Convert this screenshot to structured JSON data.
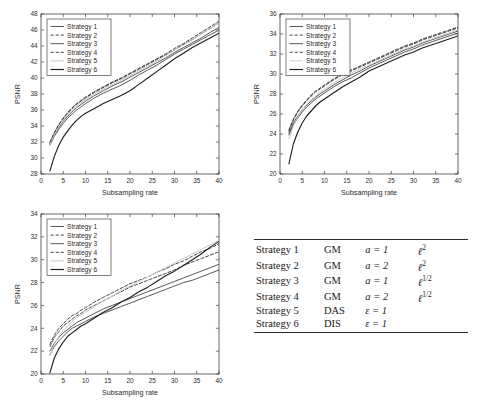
{
  "figure": {
    "axis_label_x": "Subsampling rate",
    "axis_label_y": "PSNR",
    "legend_entries": [
      "Strategy 1",
      "Strategy 2",
      "Strategy 3",
      "Strategy 4",
      "Strategy 5",
      "Strategy 6"
    ],
    "line_styles": [
      "solid",
      "dashed",
      "solid",
      "dashed",
      "solid-light",
      "solid-bold"
    ],
    "colors": {
      "axis": "#262626",
      "grid": "#d9d9d9",
      "s1": "#3a3a3a",
      "s2": "#2b2b2b",
      "s3": "#4a4a4a",
      "s4": "#333333",
      "s5": "#c9c9c9",
      "s6": "#1f1f1f"
    }
  },
  "chart_data": [
    {
      "type": "line",
      "panel": "top-left",
      "title": "",
      "xlabel": "Subsampling rate",
      "ylabel": "PSNR",
      "xlim": [
        0,
        40
      ],
      "ylim": [
        28,
        48
      ],
      "xticks": [
        0,
        5,
        10,
        15,
        20,
        25,
        30,
        35,
        40
      ],
      "yticks": [
        28,
        30,
        32,
        34,
        36,
        38,
        40,
        42,
        44,
        46,
        48
      ],
      "grid": false,
      "legend_position": "upper-left",
      "x": [
        2,
        3,
        4,
        5,
        6,
        7,
        8,
        9,
        10,
        12,
        14,
        16,
        18,
        20,
        22,
        24,
        26,
        28,
        30,
        32,
        34,
        36,
        38,
        40
      ],
      "series": [
        {
          "name": "Strategy 1",
          "style": "solid",
          "values": [
            31.6,
            32.7,
            33.6,
            34.3,
            35.0,
            35.5,
            36.0,
            36.4,
            36.8,
            37.5,
            38.1,
            38.6,
            39.1,
            39.7,
            40.4,
            41.0,
            41.6,
            42.3,
            43.0,
            43.6,
            44.2,
            44.8,
            45.4,
            46.0
          ]
        },
        {
          "name": "Strategy 2",
          "style": "dashed",
          "values": [
            31.9,
            33.1,
            34.1,
            34.9,
            35.6,
            36.2,
            36.7,
            37.1,
            37.5,
            38.2,
            38.8,
            39.4,
            39.9,
            40.5,
            41.1,
            41.7,
            42.3,
            42.9,
            43.5,
            44.2,
            44.8,
            45.5,
            46.2,
            46.9
          ]
        },
        {
          "name": "Strategy 3",
          "style": "solid",
          "values": [
            31.8,
            32.9,
            33.8,
            34.6,
            35.2,
            35.8,
            36.3,
            36.7,
            37.1,
            37.8,
            38.4,
            39.0,
            39.5,
            40.1,
            40.7,
            41.3,
            41.9,
            42.5,
            43.2,
            43.8,
            44.4,
            45.0,
            45.7,
            46.3
          ]
        },
        {
          "name": "Strategy 4",
          "style": "dashed",
          "values": [
            32.0,
            33.2,
            34.2,
            35.0,
            35.7,
            36.3,
            36.8,
            37.2,
            37.6,
            38.3,
            38.9,
            39.5,
            40.0,
            40.6,
            41.2,
            41.8,
            42.4,
            43.0,
            43.7,
            44.3,
            45.0,
            45.7,
            46.4,
            47.1
          ]
        },
        {
          "name": "Strategy 5",
          "style": "solid-light",
          "values": [
            31.7,
            32.9,
            33.9,
            34.7,
            35.4,
            36.0,
            36.5,
            36.9,
            37.3,
            38.0,
            38.6,
            39.2,
            39.7,
            40.3,
            40.9,
            41.5,
            42.1,
            42.8,
            43.5,
            44.1,
            44.8,
            45.5,
            46.2,
            46.9
          ]
        },
        {
          "name": "Strategy 6",
          "style": "solid-bold",
          "values": [
            28.4,
            30.2,
            31.6,
            32.6,
            33.4,
            34.1,
            34.7,
            35.2,
            35.6,
            36.2,
            36.8,
            37.3,
            37.8,
            38.4,
            39.2,
            40.0,
            40.8,
            41.6,
            42.4,
            43.1,
            43.8,
            44.4,
            45.0,
            45.6
          ]
        }
      ]
    },
    {
      "type": "line",
      "panel": "top-right",
      "title": "",
      "xlabel": "Subsampling rate",
      "ylabel": "PSNR",
      "xlim": [
        0,
        40
      ],
      "ylim": [
        20,
        36
      ],
      "xticks": [
        0,
        5,
        10,
        15,
        20,
        25,
        30,
        35,
        40
      ],
      "yticks": [
        20,
        22,
        24,
        26,
        28,
        30,
        32,
        34,
        36
      ],
      "grid": false,
      "legend_position": "upper-left",
      "x": [
        2,
        3,
        4,
        5,
        6,
        7,
        8,
        9,
        10,
        12,
        14,
        16,
        18,
        20,
        22,
        24,
        26,
        28,
        30,
        32,
        34,
        36,
        38,
        40
      ],
      "series": [
        {
          "name": "Strategy 1",
          "style": "solid",
          "values": [
            23.9,
            24.9,
            25.6,
            26.2,
            26.7,
            27.1,
            27.5,
            27.8,
            28.1,
            28.7,
            29.2,
            29.6,
            30.1,
            30.6,
            31.0,
            31.4,
            31.8,
            32.2,
            32.5,
            32.9,
            33.2,
            33.5,
            33.8,
            34.1
          ]
        },
        {
          "name": "Strategy 2",
          "style": "dashed",
          "values": [
            24.3,
            25.4,
            26.2,
            26.8,
            27.3,
            27.8,
            28.2,
            28.5,
            28.8,
            29.4,
            29.9,
            30.3,
            30.7,
            31.1,
            31.5,
            31.9,
            32.3,
            32.7,
            33.0,
            33.4,
            33.7,
            34.0,
            34.3,
            34.6
          ]
        },
        {
          "name": "Strategy 3",
          "style": "solid",
          "values": [
            24.1,
            25.1,
            25.8,
            26.4,
            26.9,
            27.3,
            27.7,
            28.0,
            28.3,
            28.9,
            29.4,
            29.9,
            30.3,
            30.8,
            31.2,
            31.6,
            32.0,
            32.4,
            32.7,
            33.1,
            33.4,
            33.7,
            34.0,
            34.3
          ]
        },
        {
          "name": "Strategy 4",
          "style": "dashed",
          "values": [
            24.4,
            25.5,
            26.3,
            26.9,
            27.4,
            27.9,
            28.3,
            28.6,
            28.9,
            29.5,
            30.0,
            30.4,
            30.8,
            31.2,
            31.6,
            32.0,
            32.4,
            32.8,
            33.1,
            33.5,
            33.8,
            34.1,
            34.4,
            34.7
          ]
        },
        {
          "name": "Strategy 5",
          "style": "solid-light",
          "values": [
            23.5,
            24.8,
            25.7,
            26.4,
            27.0,
            27.4,
            27.8,
            28.2,
            28.5,
            29.1,
            29.6,
            30.1,
            30.5,
            30.9,
            31.3,
            31.7,
            32.1,
            32.5,
            32.8,
            33.2,
            33.5,
            33.8,
            34.1,
            34.4
          ]
        },
        {
          "name": "Strategy 6",
          "style": "solid-bold",
          "values": [
            21.0,
            23.0,
            24.2,
            25.1,
            25.8,
            26.3,
            26.8,
            27.2,
            27.5,
            28.1,
            28.7,
            29.2,
            29.7,
            30.3,
            30.7,
            31.1,
            31.5,
            31.9,
            32.2,
            32.6,
            32.9,
            33.2,
            33.5,
            33.8
          ]
        }
      ]
    },
    {
      "type": "line",
      "panel": "bottom-left",
      "title": "",
      "xlabel": "Subsampling rate",
      "ylabel": "PSNR",
      "xlim": [
        0,
        40
      ],
      "ylim": [
        20,
        34
      ],
      "xticks": [
        0,
        5,
        10,
        15,
        20,
        25,
        30,
        35,
        40
      ],
      "yticks": [
        20,
        22,
        24,
        26,
        28,
        30,
        32,
        34
      ],
      "grid": false,
      "legend_position": "upper-left",
      "x": [
        2,
        3,
        4,
        5,
        6,
        7,
        8,
        9,
        10,
        12,
        14,
        16,
        18,
        20,
        22,
        24,
        26,
        28,
        30,
        32,
        34,
        36,
        38,
        40
      ],
      "series": [
        {
          "name": "Strategy 1",
          "style": "solid",
          "values": [
            21.7,
            22.4,
            22.9,
            23.3,
            23.7,
            24.0,
            24.2,
            24.4,
            24.6,
            25.0,
            25.3,
            25.6,
            25.9,
            26.2,
            26.5,
            26.8,
            27.1,
            27.4,
            27.7,
            28.0,
            28.2,
            28.5,
            28.8,
            29.1
          ]
        },
        {
          "name": "Strategy 2",
          "style": "dashed",
          "values": [
            22.4,
            23.2,
            23.7,
            24.2,
            24.5,
            24.8,
            25.1,
            25.3,
            25.6,
            26.0,
            26.4,
            26.8,
            27.2,
            27.6,
            27.9,
            28.2,
            28.5,
            28.8,
            29.1,
            29.5,
            29.8,
            30.1,
            30.4,
            30.7
          ]
        },
        {
          "name": "Strategy 3",
          "style": "solid",
          "values": [
            22.0,
            22.7,
            23.2,
            23.6,
            23.9,
            24.2,
            24.5,
            24.7,
            24.9,
            25.3,
            25.7,
            26.0,
            26.3,
            26.6,
            26.9,
            27.2,
            27.5,
            27.8,
            28.1,
            28.4,
            28.7,
            29.0,
            29.3,
            29.6
          ]
        },
        {
          "name": "Strategy 4",
          "style": "dashed",
          "values": [
            22.6,
            23.4,
            24.0,
            24.4,
            24.8,
            25.1,
            25.3,
            25.6,
            25.8,
            26.3,
            26.7,
            27.1,
            27.5,
            27.9,
            28.2,
            28.5,
            28.9,
            29.2,
            29.6,
            29.9,
            30.3,
            30.7,
            31.0,
            31.4
          ]
        },
        {
          "name": "Strategy 5",
          "style": "solid-light",
          "values": [
            21.6,
            22.6,
            23.3,
            23.8,
            24.2,
            24.6,
            24.9,
            25.2,
            25.4,
            25.9,
            26.4,
            26.8,
            27.3,
            27.7,
            28.1,
            28.5,
            28.9,
            29.3,
            29.7,
            30.1,
            30.5,
            30.9,
            31.3,
            31.7
          ]
        },
        {
          "name": "Strategy 6",
          "style": "solid-bold",
          "values": [
            20.1,
            21.4,
            22.2,
            22.8,
            23.3,
            23.6,
            23.9,
            24.2,
            24.4,
            24.9,
            25.4,
            25.8,
            26.3,
            26.7,
            27.2,
            27.6,
            28.1,
            28.6,
            29.0,
            29.5,
            30.0,
            30.5,
            31.1,
            31.6
          ]
        }
      ]
    }
  ],
  "table": {
    "rows": [
      {
        "name": "Strategy 1",
        "method": "GM",
        "param": "a = 1",
        "norm_base": "ℓ",
        "norm_exp": "2"
      },
      {
        "name": "Strategy 2",
        "method": "GM",
        "param": "a = 2",
        "norm_base": "ℓ",
        "norm_exp": "2"
      },
      {
        "name": "Strategy 3",
        "method": "GM",
        "param": "a = 1",
        "norm_base": "ℓ",
        "norm_exp": "1/2"
      },
      {
        "name": "Strategy 4",
        "method": "GM",
        "param": "a = 2",
        "norm_base": "ℓ",
        "norm_exp": "1/2"
      },
      {
        "name": "Strategy 5",
        "method": "DAS",
        "param": "ε = 1",
        "norm_base": "",
        "norm_exp": ""
      },
      {
        "name": "Strategy 6",
        "method": "DIS",
        "param": "ε = 1",
        "norm_base": "",
        "norm_exp": ""
      }
    ]
  }
}
